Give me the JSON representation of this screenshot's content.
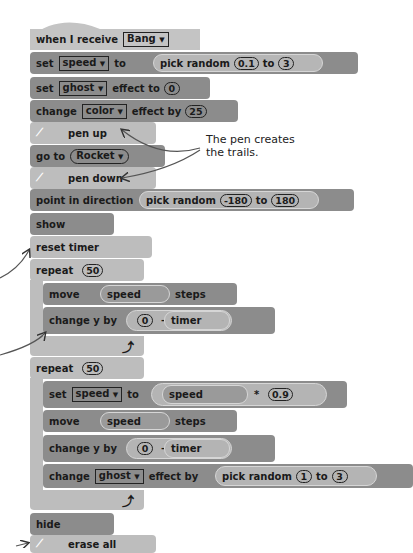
{
  "script": {
    "hat": {
      "label": "when I receive",
      "message": "Bang"
    },
    "set_speed": {
      "label_set": "set",
      "variable": "speed",
      "label_to": "to",
      "reporter": {
        "label": "pick random",
        "from": "0.1",
        "to_label": "to",
        "to": "3"
      }
    },
    "set_ghost": {
      "label_set": "set",
      "effect": "ghost",
      "label_effect_to": "effect to",
      "value": "0"
    },
    "change_color": {
      "label_change": "change",
      "effect": "color",
      "label_effect_by": "effect by",
      "value": "25"
    },
    "pen_up": {
      "label": "pen up",
      "icon": "pen-icon"
    },
    "go_to": {
      "label": "go to",
      "target": "Rocket"
    },
    "pen_down": {
      "label": "pen down",
      "icon": "pen-icon"
    },
    "point_dir": {
      "label": "point in direction",
      "reporter": {
        "label": "pick random",
        "from": "-180",
        "to_label": "to",
        "to": "180"
      }
    },
    "show": {
      "label": "show"
    },
    "reset_timer": {
      "label": "reset timer"
    },
    "repeat1": {
      "label": "repeat",
      "count": "50",
      "move": {
        "label": "move",
        "reporter": "speed",
        "label_steps": "steps"
      },
      "change_y": {
        "label": "change y by",
        "left": "0",
        "op": "–",
        "right": "timer"
      },
      "loop_icon": "loop-arrow-icon"
    },
    "repeat2": {
      "label": "repeat",
      "count": "50",
      "set_speed": {
        "label_set": "set",
        "variable": "speed",
        "label_to": "to",
        "left": "speed",
        "op": "*",
        "right": "0.9"
      },
      "move": {
        "label": "move",
        "reporter": "speed",
        "label_steps": "steps"
      },
      "change_y": {
        "label": "change y by",
        "left": "0",
        "op": "–",
        "right": "timer"
      },
      "change_ghost": {
        "label_change": "change",
        "effect": "ghost",
        "label_effect_by": "effect by",
        "reporter": {
          "label": "pick random",
          "from": "1",
          "to_label": "to",
          "to": "3"
        }
      },
      "loop_icon": "loop-arrow-icon"
    },
    "hide": {
      "label": "hide"
    },
    "erase_all": {
      "label": "erase all",
      "icon": "pen-icon"
    }
  },
  "annotations": {
    "pen_note_line1": "The pen creates",
    "pen_note_line2": "the trails."
  },
  "dropdown_arrow": "▼"
}
